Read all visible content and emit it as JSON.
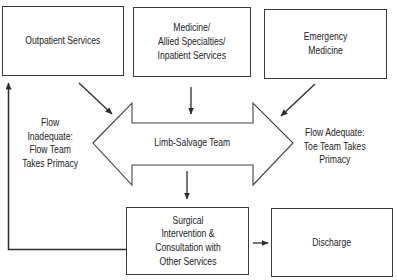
{
  "diagram": {
    "line_color": "#2e2e2e",
    "box_border_color": "#3a3a3a",
    "background": "#ffffff",
    "nodes": {
      "outpatient": {
        "lines": [
          "Outpatient Services"
        ]
      },
      "medicine": {
        "lines": [
          "Medicine/",
          "Allied Specialties/",
          "Inpatient Services"
        ]
      },
      "emergency": {
        "lines": [
          "Emergency",
          "Medicine"
        ]
      },
      "limb_salvage": {
        "lines": [
          "Limb-Salvage Team"
        ],
        "shape": "double-headed-arrow"
      },
      "surgical": {
        "lines": [
          "Surgical",
          "Intervention &",
          "Consultation with",
          "Other Services"
        ]
      },
      "discharge": {
        "lines": [
          "Discharge"
        ]
      }
    },
    "annotations": {
      "flow_inadequate": {
        "lines": [
          "Flow",
          "Inadequate:",
          "Flow Team",
          "Takes Primacy"
        ]
      },
      "flow_adequate": {
        "lines": [
          "Flow Adequate:",
          "Toe Team Takes",
          "Primacy"
        ]
      }
    },
    "edges": [
      {
        "from": "Outpatient Services",
        "to": "Limb-Salvage Team"
      },
      {
        "from": "Medicine/Allied Specialties/Inpatient Services",
        "to": "Limb-Salvage Team"
      },
      {
        "from": "Emergency Medicine",
        "to": "Limb-Salvage Team"
      },
      {
        "from": "Limb-Salvage Team",
        "to": "Surgical Intervention & Consultation with Other Services"
      },
      {
        "from": "Surgical Intervention & Consultation with Other Services",
        "to": "Discharge"
      },
      {
        "from": "Surgical Intervention & Consultation with Other Services",
        "to": "Outpatient Services"
      }
    ]
  }
}
